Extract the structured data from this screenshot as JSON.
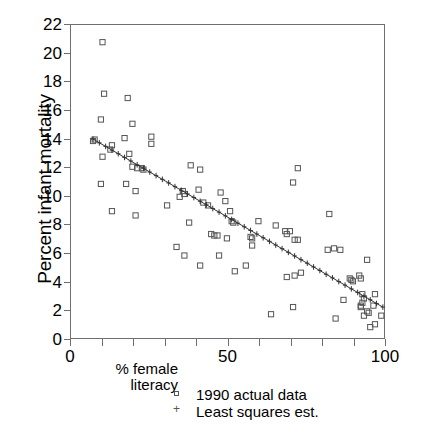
{
  "chart_data": {
    "type": "scatter",
    "title": "",
    "xlabel": "% female literacy",
    "ylabel": "Percent infant mortality",
    "xlim": [
      0,
      100
    ],
    "ylim": [
      0,
      22
    ],
    "xticks": [
      0,
      10,
      20,
      30,
      40,
      50,
      60,
      70,
      80,
      90,
      100
    ],
    "xticklabels": [
      "0",
      "",
      "",
      "",
      "",
      "50",
      "",
      "",
      "",
      "",
      "100"
    ],
    "yticks": [
      0,
      2,
      4,
      6,
      8,
      10,
      12,
      14,
      16,
      18,
      20,
      22
    ],
    "yticklabels": [
      "0",
      "2",
      "4",
      "6",
      "8",
      "10",
      "12",
      "14",
      "16",
      "18",
      "20",
      "22"
    ],
    "grid": false,
    "legend_position": "below-axes",
    "series": [
      {
        "name": "1990 actual data",
        "marker": "open-square",
        "color": "#555555",
        "points": [
          [
            10.0,
            20.8
          ],
          [
            10.5,
            17.2
          ],
          [
            9.5,
            15.4
          ],
          [
            18.0,
            16.9
          ],
          [
            19.5,
            15.1
          ],
          [
            7.0,
            13.9
          ],
          [
            7.5,
            14.0
          ],
          [
            17.0,
            14.1
          ],
          [
            25.5,
            14.2
          ],
          [
            25.5,
            13.7
          ],
          [
            13.0,
            13.6
          ],
          [
            12.5,
            13.3
          ],
          [
            18.5,
            13.0
          ],
          [
            10.0,
            12.8
          ],
          [
            19.5,
            12.1
          ],
          [
            21.0,
            12.0
          ],
          [
            22.5,
            12.0
          ],
          [
            23.0,
            11.9
          ],
          [
            38.0,
            12.2
          ],
          [
            41.0,
            11.9
          ],
          [
            72.0,
            12.0
          ],
          [
            70.5,
            11.0
          ],
          [
            9.5,
            10.9
          ],
          [
            17.5,
            10.9
          ],
          [
            20.5,
            10.4
          ],
          [
            35.5,
            10.4
          ],
          [
            36.0,
            10.2
          ],
          [
            40.5,
            10.5
          ],
          [
            34.5,
            10.0
          ],
          [
            47.5,
            10.3
          ],
          [
            49.0,
            9.7
          ],
          [
            42.0,
            9.6
          ],
          [
            43.5,
            9.4
          ],
          [
            30.5,
            9.4
          ],
          [
            13.0,
            9.0
          ],
          [
            20.5,
            8.7
          ],
          [
            50.5,
            9.0
          ],
          [
            51.0,
            8.3
          ],
          [
            51.5,
            8.2
          ],
          [
            59.5,
            8.3
          ],
          [
            65.0,
            8.0
          ],
          [
            82.0,
            8.8
          ],
          [
            37.5,
            8.2
          ],
          [
            44.5,
            7.4
          ],
          [
            45.5,
            7.3
          ],
          [
            46.5,
            7.3
          ],
          [
            49.5,
            7.1
          ],
          [
            57.0,
            7.2
          ],
          [
            57.5,
            7.1
          ],
          [
            68.0,
            7.6
          ],
          [
            69.5,
            7.6
          ],
          [
            68.5,
            7.4
          ],
          [
            71.0,
            7.0
          ],
          [
            72.0,
            7.0
          ],
          [
            57.5,
            6.6
          ],
          [
            33.5,
            6.5
          ],
          [
            47.0,
            5.9
          ],
          [
            36.0,
            5.9
          ],
          [
            81.5,
            6.3
          ],
          [
            83.5,
            6.4
          ],
          [
            85.5,
            6.3
          ],
          [
            94.0,
            5.6
          ],
          [
            41.0,
            5.2
          ],
          [
            55.5,
            5.2
          ],
          [
            52.0,
            4.8
          ],
          [
            68.5,
            4.4
          ],
          [
            73.0,
            4.7
          ],
          [
            71.0,
            4.5
          ],
          [
            88.5,
            4.3
          ],
          [
            89.0,
            4.2
          ],
          [
            89.5,
            4.1
          ],
          [
            91.5,
            4.5
          ],
          [
            92.0,
            4.3
          ],
          [
            96.5,
            3.2
          ],
          [
            92.5,
            3.2
          ],
          [
            93.0,
            2.9
          ],
          [
            92.5,
            2.6
          ],
          [
            92.0,
            2.4
          ],
          [
            92.0,
            2.3
          ],
          [
            96.0,
            2.4
          ],
          [
            86.5,
            2.8
          ],
          [
            70.5,
            2.3
          ],
          [
            94.0,
            2.0
          ],
          [
            94.5,
            1.9
          ],
          [
            93.0,
            1.7
          ],
          [
            63.5,
            1.8
          ],
          [
            84.0,
            1.5
          ],
          [
            98.5,
            1.7
          ],
          [
            96.5,
            1.1
          ],
          [
            95.0,
            0.9
          ]
        ]
      },
      {
        "name": "Least squares est.",
        "marker": "plus",
        "line": true,
        "color": "#333333",
        "fit": {
          "intercept": 14.92,
          "slope": -0.1275
        },
        "x_start": 7.0,
        "x_end": 99.0,
        "points": [
          [
            7.0,
            14.03
          ],
          [
            9.0,
            13.77
          ],
          [
            11.0,
            13.52
          ],
          [
            13.0,
            13.26
          ],
          [
            15.0,
            13.01
          ],
          [
            17.0,
            12.75
          ],
          [
            19.0,
            12.5
          ],
          [
            21.0,
            12.24
          ],
          [
            23.0,
            11.99
          ],
          [
            25.0,
            11.73
          ],
          [
            27.0,
            11.48
          ],
          [
            29.0,
            11.22
          ],
          [
            31.0,
            10.97
          ],
          [
            33.0,
            10.71
          ],
          [
            35.0,
            10.46
          ],
          [
            37.0,
            10.2
          ],
          [
            39.0,
            9.95
          ],
          [
            41.0,
            9.69
          ],
          [
            43.0,
            9.44
          ],
          [
            45.0,
            9.18
          ],
          [
            47.0,
            8.93
          ],
          [
            49.0,
            8.67
          ],
          [
            51.0,
            8.42
          ],
          [
            53.0,
            8.16
          ],
          [
            55.0,
            7.91
          ],
          [
            57.0,
            7.65
          ],
          [
            59.0,
            7.4
          ],
          [
            61.0,
            7.14
          ],
          [
            63.0,
            6.89
          ],
          [
            65.0,
            6.63
          ],
          [
            67.0,
            6.38
          ],
          [
            69.0,
            6.12
          ],
          [
            71.0,
            5.87
          ],
          [
            73.0,
            5.61
          ],
          [
            75.0,
            5.36
          ],
          [
            77.0,
            5.1
          ],
          [
            79.0,
            4.85
          ],
          [
            81.0,
            4.59
          ],
          [
            83.0,
            4.34
          ],
          [
            85.0,
            4.08
          ],
          [
            87.0,
            3.83
          ],
          [
            89.0,
            3.57
          ],
          [
            91.0,
            3.32
          ],
          [
            93.0,
            3.06
          ],
          [
            95.0,
            2.81
          ],
          [
            97.0,
            2.55
          ],
          [
            99.0,
            2.3
          ]
        ]
      }
    ]
  },
  "axis": {
    "y_title": "Percent infant mortality",
    "x_caption_line1": "% female",
    "x_caption_line2": "literacy"
  },
  "legend": {
    "entries": [
      {
        "label": "1990 actual data",
        "marker": "open-square"
      },
      {
        "label": "Least squares est.",
        "marker": "plus"
      }
    ]
  },
  "colors": {
    "frame": "#6f6f6f",
    "marker": "#555555",
    "fit_line": "#333333",
    "text": "#000000",
    "background": "#ffffff"
  }
}
